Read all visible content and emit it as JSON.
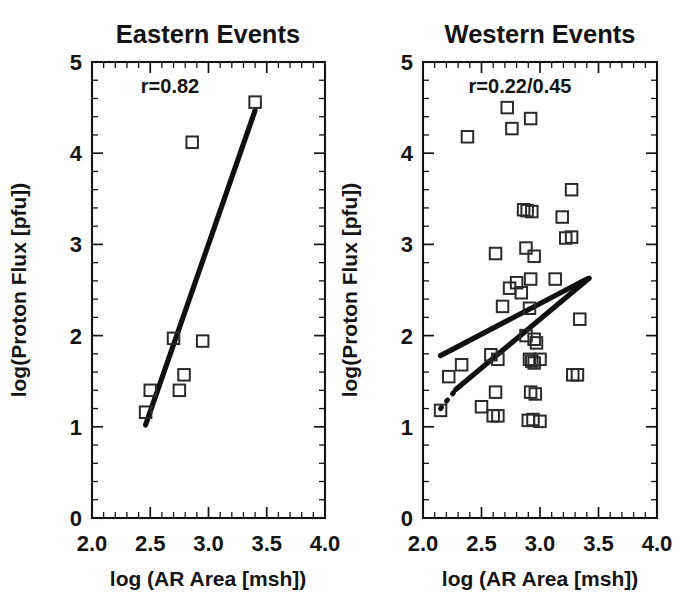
{
  "figure": {
    "background": "#ffffff",
    "foreground": "#141414",
    "width": 681,
    "height": 602
  },
  "chart_data": [
    {
      "type": "scatter",
      "panel_id": "eastern",
      "title": "Eastern Events",
      "annotation": "r=0.82",
      "correlation": 0.82,
      "xlabel": "log (AR Area [msh])",
      "ylabel": "log(Proton Flux [pfu])",
      "xlim": [
        2.0,
        4.0
      ],
      "ylim": [
        0,
        5
      ],
      "xticks": [
        2.0,
        2.5,
        3.0,
        3.5,
        4.0
      ],
      "xticklabels": [
        "2.0",
        "2.5",
        "3.0",
        "3.5",
        "4.0"
      ],
      "yticks": [
        0,
        1,
        2,
        3,
        4,
        5
      ],
      "yticklabels": [
        "0",
        "1",
        "2",
        "3",
        "4",
        "5"
      ],
      "minor_ticks_per_interval_x": 5,
      "minor_ticks_per_interval_y": 5,
      "grid": false,
      "legend": "none",
      "marker": "open-square",
      "points": [
        {
          "x": 2.46,
          "y": 1.16
        },
        {
          "x": 2.5,
          "y": 1.4
        },
        {
          "x": 2.7,
          "y": 1.97
        },
        {
          "x": 2.75,
          "y": 1.4
        },
        {
          "x": 2.79,
          "y": 1.57
        },
        {
          "x": 2.86,
          "y": 4.12
        },
        {
          "x": 2.95,
          "y": 1.94
        },
        {
          "x": 3.4,
          "y": 4.56
        }
      ],
      "fits": [
        {
          "name": "eastern-regression",
          "style": "solid",
          "x0": 2.46,
          "y0": 1.02,
          "x1": 3.4,
          "y1": 4.47
        }
      ]
    },
    {
      "type": "scatter",
      "panel_id": "western",
      "title": "Western Events",
      "annotation": "r=0.22/0.45",
      "correlation": [
        0.22,
        0.45
      ],
      "xlabel": "log (AR Area [msh])",
      "ylabel": "log(Proton Flux [pfu])",
      "xlim": [
        2.0,
        4.0
      ],
      "ylim": [
        0,
        5
      ],
      "xticks": [
        2.0,
        2.5,
        3.0,
        3.5,
        4.0
      ],
      "xticklabels": [
        "2.0",
        "2.5",
        "3.0",
        "3.5",
        "4.0"
      ],
      "yticks": [
        0,
        1,
        2,
        3,
        4,
        5
      ],
      "yticklabels": [
        "0",
        "1",
        "2",
        "3",
        "4",
        "5"
      ],
      "minor_ticks_per_interval_x": 5,
      "minor_ticks_per_interval_y": 5,
      "grid": false,
      "legend": "none",
      "marker": "open-square",
      "points": [
        {
          "x": 2.38,
          "y": 4.18
        },
        {
          "x": 2.72,
          "y": 4.5
        },
        {
          "x": 2.76,
          "y": 4.27
        },
        {
          "x": 2.92,
          "y": 4.38
        },
        {
          "x": 3.27,
          "y": 3.6
        },
        {
          "x": 2.86,
          "y": 3.38
        },
        {
          "x": 2.89,
          "y": 3.37
        },
        {
          "x": 2.93,
          "y": 3.36
        },
        {
          "x": 3.19,
          "y": 3.3
        },
        {
          "x": 3.22,
          "y": 3.07
        },
        {
          "x": 3.27,
          "y": 3.08
        },
        {
          "x": 2.62,
          "y": 2.9
        },
        {
          "x": 2.88,
          "y": 2.96
        },
        {
          "x": 2.95,
          "y": 2.87
        },
        {
          "x": 2.8,
          "y": 2.58
        },
        {
          "x": 2.92,
          "y": 2.62
        },
        {
          "x": 3.13,
          "y": 2.62
        },
        {
          "x": 2.74,
          "y": 2.52
        },
        {
          "x": 2.84,
          "y": 2.47
        },
        {
          "x": 2.68,
          "y": 2.32
        },
        {
          "x": 2.91,
          "y": 2.3
        },
        {
          "x": 3.34,
          "y": 2.18
        },
        {
          "x": 2.88,
          "y": 2.0
        },
        {
          "x": 2.95,
          "y": 1.96
        },
        {
          "x": 2.97,
          "y": 1.92
        },
        {
          "x": 2.58,
          "y": 1.79
        },
        {
          "x": 2.64,
          "y": 1.74
        },
        {
          "x": 2.91,
          "y": 1.74
        },
        {
          "x": 2.93,
          "y": 1.72
        },
        {
          "x": 2.95,
          "y": 1.7
        },
        {
          "x": 3.0,
          "y": 1.74
        },
        {
          "x": 2.33,
          "y": 1.68
        },
        {
          "x": 3.28,
          "y": 1.57
        },
        {
          "x": 3.32,
          "y": 1.57
        },
        {
          "x": 2.22,
          "y": 1.55
        },
        {
          "x": 2.62,
          "y": 1.38
        },
        {
          "x": 2.92,
          "y": 1.38
        },
        {
          "x": 2.96,
          "y": 1.36
        },
        {
          "x": 2.5,
          "y": 1.22
        },
        {
          "x": 2.15,
          "y": 1.18
        },
        {
          "x": 2.6,
          "y": 1.12
        },
        {
          "x": 2.64,
          "y": 1.12
        },
        {
          "x": 2.9,
          "y": 1.07
        },
        {
          "x": 2.94,
          "y": 1.08
        },
        {
          "x": 3.0,
          "y": 1.06
        }
      ],
      "fits": [
        {
          "name": "western-regression-shallow",
          "style": "solid",
          "x0": 2.15,
          "y0": 1.78,
          "x1": 3.4,
          "y1": 2.62
        },
        {
          "name": "western-regression-steep",
          "style": "solid",
          "x0": 2.28,
          "y0": 1.41,
          "x1": 3.42,
          "y1": 2.63
        },
        {
          "name": "western-regression-steep-extension",
          "style": "dotted",
          "x0": 2.15,
          "y0": 1.2,
          "x1": 2.29,
          "y1": 1.42
        }
      ]
    }
  ]
}
